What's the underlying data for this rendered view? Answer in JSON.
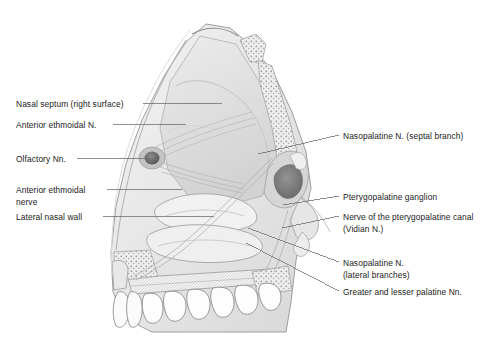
{
  "figure": {
    "background_color": "#ffffff",
    "line_color": "#5a5a5a",
    "text_color": "#1b1b1b",
    "ink_dark": "#6e6e6e",
    "ink_mid": "#bdbdbd",
    "ink_light": "#e3e3e3",
    "ink_pale": "#f1f1f1"
  },
  "labels_left": [
    {
      "text": "Nasal septum (right surface)",
      "x": 16,
      "y": 99,
      "leader": {
        "x1": 143,
        "y1": 103,
        "x2": 222,
        "y2": 103
      }
    },
    {
      "text": "Anterior ethmoidal N.",
      "x": 16,
      "y": 120,
      "leader": {
        "x1": 113,
        "y1": 124,
        "x2": 186,
        "y2": 124
      }
    },
    {
      "text": "Olfactory Nn.",
      "x": 16,
      "y": 154,
      "leader": {
        "x1": 77,
        "y1": 158,
        "x2": 150,
        "y2": 158
      }
    },
    {
      "text": "Anterior ethmoidal",
      "x": 16,
      "y": 185,
      "leader": {
        "x1": 107,
        "y1": 189,
        "x2": 182,
        "y2": 189
      }
    },
    {
      "text": "nerve",
      "x": 16,
      "y": 197,
      "leader": null
    },
    {
      "text": "Lateral nasal wall",
      "x": 16,
      "y": 212,
      "leader": {
        "x1": 103,
        "y1": 216,
        "x2": 214,
        "y2": 216
      }
    }
  ],
  "labels_right": [
    {
      "text": "Nasopalatine N. (septal branch)",
      "x": 343,
      "y": 131,
      "leader": {
        "x1": 258,
        "y1": 154,
        "x2": 339,
        "y2": 135
      }
    },
    {
      "text": "Pterygopalatine ganglion",
      "x": 343,
      "y": 192,
      "leader": {
        "x1": 283,
        "y1": 205,
        "x2": 339,
        "y2": 196
      }
    },
    {
      "text": "Nerve of the pterygopalatine canal",
      "x": 343,
      "y": 212,
      "leader": {
        "x1": 282,
        "y1": 228,
        "x2": 339,
        "y2": 216
      }
    },
    {
      "text": "(Vidian N.)",
      "x": 343,
      "y": 224,
      "leader": null
    },
    {
      "text": "Nasopalatine N.",
      "x": 343,
      "y": 258,
      "leader": {
        "x1": 248,
        "y1": 228,
        "x2": 339,
        "y2": 262
      }
    },
    {
      "text": "(lateral branches)",
      "x": 343,
      "y": 270,
      "leader": null
    },
    {
      "text": "Greater and lesser palatine Nn.",
      "x": 343,
      "y": 287,
      "leader": {
        "x1": 246,
        "y1": 243,
        "x2": 339,
        "y2": 291
      }
    }
  ]
}
